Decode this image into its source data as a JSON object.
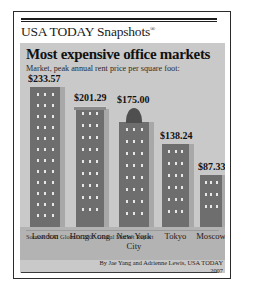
{
  "brand": {
    "name": "USA TODAY Snapshots",
    "registered_mark": "®"
  },
  "chart_data": {
    "type": "bar",
    "title": "Most expensive office markets",
    "subtitle": "Market, peak annual rent price per square foot:",
    "categories": [
      "London",
      "Hong Kong",
      "New York City",
      "Tokyo",
      "Moscow"
    ],
    "values": [
      233.57,
      201.29,
      175.0,
      138.24,
      87.33
    ],
    "value_labels": [
      "$233.57",
      "$201.29",
      "$175.00",
      "$138.24",
      "$87.33"
    ],
    "xlabel": "",
    "ylabel": "",
    "ylim": [
      0,
      233.57
    ],
    "grid": false,
    "legend": "none",
    "units": "USD per square foot, peak annual rent",
    "source": "Source: NAI Global's 2007 Global Market Report"
  },
  "credit": {
    "byline": "By Jae Yang and Adrienne Lewis, USA TODAY",
    "year": "2007"
  },
  "colors": {
    "panel_background": "#c9c9c9",
    "ground_band": "#b3b3b3",
    "building_face": "#6e6e6e",
    "building_side": "#a8a8a8",
    "window": "#e8e8e8",
    "text": "#111111",
    "border": "#2b2b2b"
  }
}
